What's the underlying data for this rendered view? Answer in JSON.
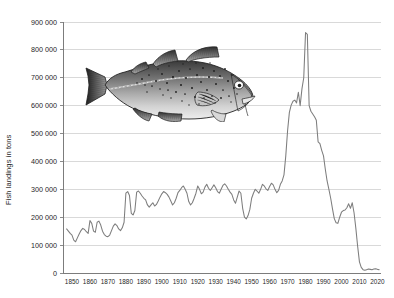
{
  "figure": {
    "name": "atlantic-cod-landings-chart",
    "background_color": "#ffffff",
    "line_color": "#7d7d7d",
    "grid_color": "#c9c9c9",
    "axis_color": "#6e6e6e"
  },
  "illustration": {
    "name": "atlantic-cod-fish",
    "alt_text": "Atlantic cod",
    "x": 83,
    "y": 46,
    "width": 178,
    "height": 76
  },
  "chart_data": {
    "type": "line",
    "title": "",
    "subtitle": "",
    "xlabel": "",
    "ylabel": "Fish landings in tons",
    "xlim": [
      1845,
      2022
    ],
    "ylim": [
      0,
      900000
    ],
    "grid": true,
    "legend": false,
    "y_ticks": [
      0,
      100000,
      200000,
      300000,
      400000,
      500000,
      600000,
      700000,
      800000,
      900000
    ],
    "y_tick_labels": [
      "0",
      "100 000",
      "200 000",
      "300 000",
      "400 000",
      "500 000",
      "600 000",
      "700 000",
      "800 000",
      "900 000"
    ],
    "x_ticks": [
      1850,
      1860,
      1870,
      1880,
      1890,
      1900,
      1910,
      1920,
      1930,
      1940,
      1950,
      1960,
      1970,
      1980,
      1990,
      2000,
      2010,
      2020
    ],
    "x_tick_labels": [
      "1850",
      "1860",
      "1870",
      "1880",
      "1890",
      "1900",
      "1910",
      "1920",
      "1930",
      "1940",
      "1950",
      "1960",
      "1970",
      "1980",
      "1990",
      "2000",
      "2010",
      "2020"
    ],
    "series": [
      {
        "name": "Fish landings",
        "color": "#7d7d7d",
        "x": [
          1847,
          1848,
          1849,
          1850,
          1851,
          1852,
          1853,
          1854,
          1855,
          1856,
          1857,
          1858,
          1859,
          1860,
          1861,
          1862,
          1863,
          1864,
          1865,
          1866,
          1867,
          1868,
          1869,
          1870,
          1871,
          1872,
          1873,
          1874,
          1875,
          1876,
          1877,
          1878,
          1879,
          1880,
          1881,
          1882,
          1883,
          1884,
          1885,
          1886,
          1887,
          1888,
          1889,
          1890,
          1891,
          1892,
          1893,
          1894,
          1895,
          1896,
          1897,
          1898,
          1899,
          1900,
          1901,
          1902,
          1903,
          1904,
          1905,
          1906,
          1907,
          1908,
          1909,
          1910,
          1911,
          1912,
          1913,
          1914,
          1915,
          1916,
          1917,
          1918,
          1919,
          1920,
          1921,
          1922,
          1923,
          1924,
          1925,
          1926,
          1927,
          1928,
          1929,
          1930,
          1931,
          1932,
          1933,
          1934,
          1935,
          1936,
          1937,
          1938,
          1939,
          1940,
          1941,
          1942,
          1943,
          1944,
          1945,
          1946,
          1947,
          1948,
          1949,
          1950,
          1951,
          1952,
          1953,
          1954,
          1955,
          1956,
          1957,
          1958,
          1959,
          1960,
          1961,
          1962,
          1963,
          1964,
          1965,
          1966,
          1967,
          1968,
          1969,
          1970,
          1971,
          1972,
          1973,
          1974,
          1975,
          1976,
          1977,
          1978,
          1979,
          1980,
          1981,
          1982,
          1983,
          1984,
          1985,
          1986,
          1987,
          1988,
          1989,
          1990,
          1991,
          1992,
          1993,
          1994,
          1995,
          1996,
          1997,
          1998,
          1999,
          2000,
          2001,
          2002,
          2003,
          2004,
          2005,
          2006,
          2007,
          2008,
          2009,
          2010,
          2011,
          2012,
          2013,
          2014,
          2015,
          2016,
          2017,
          2018,
          2019,
          2020,
          2021
        ],
        "values": [
          158000,
          150000,
          142000,
          136000,
          118000,
          112000,
          126000,
          140000,
          152000,
          160000,
          156000,
          148000,
          142000,
          188000,
          178000,
          150000,
          146000,
          182000,
          186000,
          172000,
          150000,
          138000,
          132000,
          130000,
          136000,
          152000,
          168000,
          176000,
          170000,
          158000,
          152000,
          162000,
          182000,
          286000,
          292000,
          278000,
          214000,
          208000,
          224000,
          290000,
          294000,
          286000,
          276000,
          268000,
          262000,
          244000,
          236000,
          244000,
          252000,
          240000,
          246000,
          258000,
          272000,
          284000,
          292000,
          288000,
          282000,
          272000,
          258000,
          244000,
          252000,
          268000,
          288000,
          296000,
          306000,
          312000,
          300000,
          286000,
          256000,
          244000,
          252000,
          268000,
          286000,
          312000,
          300000,
          284000,
          290000,
          308000,
          318000,
          304000,
          296000,
          306000,
          316000,
          306000,
          292000,
          286000,
          300000,
          314000,
          320000,
          312000,
          300000,
          290000,
          282000,
          262000,
          250000,
          272000,
          294000,
          286000,
          232000,
          200000,
          194000,
          206000,
          228000,
          268000,
          286000,
          300000,
          294000,
          286000,
          300000,
          318000,
          312000,
          302000,
          296000,
          310000,
          322000,
          316000,
          300000,
          288000,
          296000,
          318000,
          330000,
          352000,
          420000,
          510000,
          576000,
          602000,
          616000,
          620000,
          610000,
          648000,
          600000,
          660000,
          700000,
          862000,
          856000,
          600000,
          580000,
          570000,
          560000,
          548000,
          470000,
          464000,
          440000,
          420000,
          372000,
          330000,
          300000,
          268000,
          230000,
          195000,
          180000,
          178000,
          200000,
          218000,
          224000,
          226000,
          234000,
          248000,
          232000,
          252000,
          216000,
          160000,
          96000,
          40000,
          20000,
          12000,
          10000,
          12000,
          14000,
          13000,
          12000,
          14000,
          15000,
          13000,
          12000
        ]
      }
    ]
  }
}
